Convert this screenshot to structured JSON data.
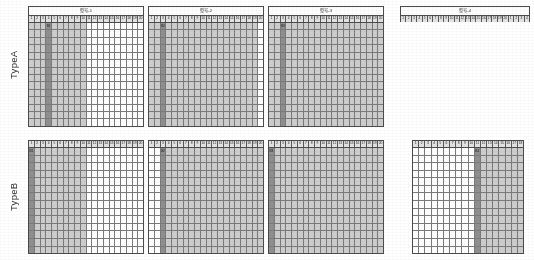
{
  "figure": {
    "row_labels": [
      "TypeA",
      "TypeB"
    ],
    "column_count": 20,
    "row_count": 14,
    "colors": {
      "fill_gray": "#cdcdcd",
      "fill_dark": "#8f8f8f",
      "fill_white": "#ffffff",
      "grid_line": "#7a7a7a",
      "border": "#4b4b4b",
      "header_bg": "#e2e2e2",
      "text": "#242424"
    },
    "column_headers": [
      "1",
      "2",
      "3",
      "4",
      "5",
      "6",
      "7",
      "8",
      "9",
      "10",
      "11",
      "12",
      "13",
      "14",
      "15",
      "16",
      "17",
      "18",
      "19",
      "20"
    ]
  },
  "panels": [
    {
      "id": "a1",
      "row": "TypeA",
      "title": "型号-1",
      "rows": 14,
      "cols": 20,
      "gray_from": 1,
      "gray_to": 10,
      "dark_col": 4,
      "dark_label": "B1",
      "has_body": true
    },
    {
      "id": "a2",
      "row": "TypeA",
      "title": "型号-2",
      "rows": 14,
      "cols": 20,
      "gray_from": 1,
      "gray_to": 19,
      "dark_col": 3,
      "dark_label": "B2",
      "has_body": true
    },
    {
      "id": "a3",
      "row": "TypeA",
      "title": "型号-3",
      "rows": 14,
      "cols": 20,
      "gray_from": 1,
      "gray_to": 20,
      "dark_col": 3,
      "dark_label": "B3",
      "has_body": true
    },
    {
      "id": "a4",
      "row": "TypeA",
      "title": "型号-4",
      "rows": 0,
      "cols": 24,
      "gray_from": 0,
      "gray_to": 0,
      "dark_col": 0,
      "dark_label": "",
      "has_body": false
    },
    {
      "id": "b1",
      "row": "TypeB",
      "title": "",
      "rows": 14,
      "cols": 20,
      "gray_from": 1,
      "gray_to": 10,
      "dark_col": 1,
      "dark_label": "B1",
      "has_body": true
    },
    {
      "id": "b2",
      "row": "TypeB",
      "title": "",
      "rows": 14,
      "cols": 20,
      "gray_from": 4,
      "gray_to": 20,
      "dark_col": 3,
      "dark_label": "B2",
      "has_body": true
    },
    {
      "id": "b3",
      "row": "TypeB",
      "title": "",
      "rows": 14,
      "cols": 20,
      "gray_from": 2,
      "gray_to": 20,
      "dark_col": 1,
      "dark_label": "B3",
      "has_body": true
    },
    {
      "id": "b4",
      "row": "TypeB",
      "title": "",
      "rows": 14,
      "cols": 18,
      "gray_from": 12,
      "gray_to": 18,
      "dark_col": 11,
      "dark_label": "B4",
      "has_body": true
    }
  ]
}
